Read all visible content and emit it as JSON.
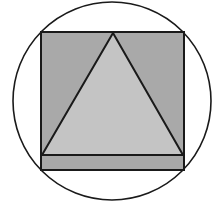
{
  "diagram": {
    "canvas": {
      "width": 217,
      "height": 208,
      "background": "#ffffff"
    },
    "circle": {
      "cx": 112,
      "cy": 101,
      "r": 99,
      "stroke": "#1a1a1a",
      "fill": "none",
      "stroke_width": 1.6
    },
    "square": {
      "x": 41,
      "y": 32,
      "width": 143,
      "height": 138,
      "fill": "#a9a9a9",
      "stroke": "#1a1a1a",
      "stroke_width": 2
    },
    "base_line": {
      "x1": 41,
      "y1": 155,
      "x2": 184,
      "y2": 155
    },
    "triangle": {
      "points": [
        [
          113,
          33
        ],
        [
          42,
          155
        ],
        [
          183,
          155
        ]
      ],
      "fill": "#c4c4c4",
      "stroke": "#1a1a1a",
      "stroke_width": 2
    }
  }
}
